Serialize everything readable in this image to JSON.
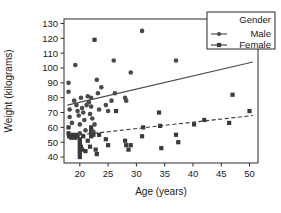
{
  "chart_data": {
    "type": "scatter",
    "title": "",
    "xlabel": "Age (years)",
    "ylabel": "Weight (kilograms)",
    "xlim": [
      17.2,
      51.5
    ],
    "ylim": [
      36,
      133
    ],
    "xticks": [
      20,
      25,
      30,
      35,
      40,
      45,
      50
    ],
    "yticks": [
      40,
      50,
      60,
      70,
      80,
      90,
      100,
      110,
      120,
      130
    ],
    "grid": false,
    "legend": {
      "title": "Gender",
      "position": "top-right",
      "entries": [
        {
          "name": "Male",
          "marker": "circle",
          "linestyle": "solid"
        },
        {
          "name": "Female",
          "marker": "square",
          "linestyle": "dashed"
        }
      ]
    },
    "series": [
      {
        "name": "Male",
        "marker": "circle",
        "color": "#4a4a4a",
        "points": [
          [
            18.0,
            90
          ],
          [
            18.0,
            84
          ],
          [
            18.2,
            72
          ],
          [
            18.2,
            67
          ],
          [
            18.6,
            63
          ],
          [
            19.0,
            78
          ],
          [
            19.2,
            102
          ],
          [
            19.4,
            75
          ],
          [
            19.6,
            71
          ],
          [
            19.8,
            68
          ],
          [
            20.0,
            62
          ],
          [
            20.0,
            56
          ],
          [
            20.2,
            80
          ],
          [
            20.4,
            73
          ],
          [
            20.6,
            70
          ],
          [
            20.8,
            65
          ],
          [
            21.0,
            58
          ],
          [
            21.2,
            75
          ],
          [
            21.4,
            81
          ],
          [
            21.6,
            77
          ],
          [
            21.8,
            69
          ],
          [
            22.0,
            80
          ],
          [
            22.0,
            74
          ],
          [
            22.2,
            66
          ],
          [
            22.4,
            57
          ],
          [
            22.6,
            62
          ],
          [
            23.0,
            92
          ],
          [
            23.2,
            83
          ],
          [
            23.4,
            72
          ],
          [
            23.8,
            87
          ],
          [
            24.6,
            75
          ],
          [
            25.0,
            71
          ],
          [
            25.6,
            78
          ],
          [
            26.0,
            105
          ],
          [
            26.2,
            83
          ],
          [
            28.0,
            80
          ],
          [
            28.2,
            78
          ],
          [
            29.0,
            97
          ],
          [
            31.0,
            125
          ],
          [
            37.0,
            105
          ]
        ],
        "trendline": {
          "x": [
            17.8,
            50.6
          ],
          "y": [
            75,
            104
          ],
          "style": "solid"
        }
      },
      {
        "name": "Female",
        "marker": "square",
        "color": "#3a3a3a",
        "points": [
          [
            18.0,
            60
          ],
          [
            18.0,
            56
          ],
          [
            18.1,
            54
          ],
          [
            18.3,
            54
          ],
          [
            18.5,
            53
          ],
          [
            18.7,
            55
          ],
          [
            19.0,
            54
          ],
          [
            19.2,
            53
          ],
          [
            19.4,
            55
          ],
          [
            19.6,
            54
          ],
          [
            20.0,
            52
          ],
          [
            20.0,
            50
          ],
          [
            20.0,
            48
          ],
          [
            20.0,
            46
          ],
          [
            20.0,
            44
          ],
          [
            20.0,
            42
          ],
          [
            20.0,
            40
          ],
          [
            20.2,
            47
          ],
          [
            20.4,
            45
          ],
          [
            20.6,
            54
          ],
          [
            21.0,
            44
          ],
          [
            21.4,
            51
          ],
          [
            21.8,
            47
          ],
          [
            22.0,
            60
          ],
          [
            22.0,
            58
          ],
          [
            22.0,
            56
          ],
          [
            22.0,
            54
          ],
          [
            22.2,
            57
          ],
          [
            22.4,
            55
          ],
          [
            22.6,
            119
          ],
          [
            22.8,
            45
          ],
          [
            23.0,
            42
          ],
          [
            23.4,
            55
          ],
          [
            24.6,
            52
          ],
          [
            25.0,
            48
          ],
          [
            26.4,
            71
          ],
          [
            28.0,
            51
          ],
          [
            28.2,
            48
          ],
          [
            28.6,
            45
          ],
          [
            29.0,
            48
          ],
          [
            31.0,
            54
          ],
          [
            31.2,
            60
          ],
          [
            34.0,
            70
          ],
          [
            34.2,
            61
          ],
          [
            34.4,
            46
          ],
          [
            37.0,
            55
          ],
          [
            37.4,
            50
          ],
          [
            40.2,
            62
          ],
          [
            42.0,
            65
          ],
          [
            46.4,
            63
          ],
          [
            47.0,
            82
          ],
          [
            50.0,
            71
          ]
        ],
        "trendline": {
          "x": [
            17.8,
            50.6
          ],
          "y": [
            54,
            68
          ],
          "style": "dashed"
        }
      }
    ]
  }
}
